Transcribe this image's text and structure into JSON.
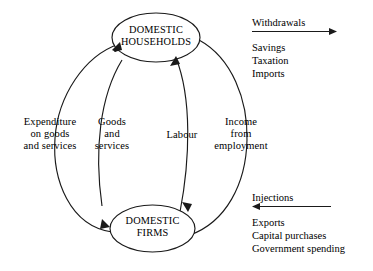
{
  "diagram": {
    "nodes": [
      {
        "id": "households",
        "line1": "DOMESTIC",
        "line2": "HOUSEHOLDS"
      },
      {
        "id": "firms",
        "line1": "DOMESTIC",
        "line2": "FIRMS"
      }
    ],
    "flow_labels": [
      {
        "id": "expenditure",
        "text": "Expenditure\non goods\nand services"
      },
      {
        "id": "goods",
        "text": "Goods\nand\nservices"
      },
      {
        "id": "labour",
        "text": "Labour"
      },
      {
        "id": "income",
        "text": "Income\nfrom\nemployment"
      }
    ],
    "withdrawals": {
      "heading": "Withdrawals",
      "items": [
        "Savings",
        "Taxation",
        "Imports"
      ],
      "direction": "right"
    },
    "injections": {
      "heading": "Injections",
      "items": [
        "Exports",
        "Capital purchases",
        "Government spending"
      ],
      "direction": "left"
    },
    "colors": {
      "stroke": "#1a1a1a",
      "text": "#000000",
      "background": "#ffffff"
    }
  }
}
